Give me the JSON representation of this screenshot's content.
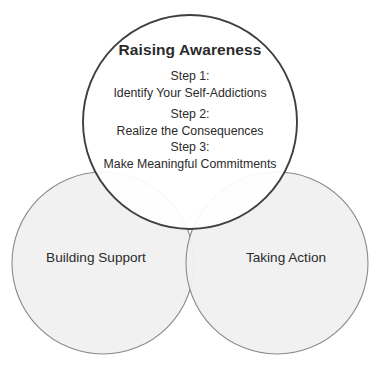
{
  "diagram": {
    "type": "venn-three-circle",
    "background_color": "#ffffff",
    "top_circle": {
      "label": "Raising Awareness",
      "fill_color": "#ffffff",
      "stroke_color": "#3f3f3f",
      "center_x": 190,
      "center_y": 122,
      "radius": 107
    },
    "left_circle": {
      "label": "Building Support",
      "fill_color": "#f0f0f0",
      "stroke_color": "#8a8a8a",
      "center_x": 103,
      "center_y": 263,
      "radius": 91
    },
    "right_circle": {
      "label": "Taking Action",
      "fill_color": "#f0f0f0",
      "stroke_color": "#8a8a8a",
      "center_x": 277,
      "center_y": 263,
      "radius": 91
    },
    "steps": [
      {
        "label": "Step 1:",
        "description": "Identify Your Self-Addictions"
      },
      {
        "label": "Step 2:",
        "description": "Realize the Consequences"
      },
      {
        "label": "Step 3:",
        "description": "Make Meaningful Commitments"
      }
    ]
  }
}
